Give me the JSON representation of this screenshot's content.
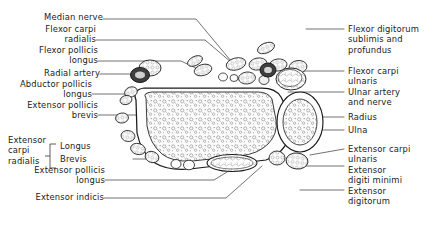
{
  "figure": {
    "type": "anatomical-cross-section",
    "region": "forearm transverse section",
    "background_color": "#ffffff",
    "line_color": "#1a1a1a",
    "artery_fill": "#555555",
    "bone_fill": "#f2f2f2",
    "muscle_fill": "#fafafa"
  },
  "labels_left": [
    {
      "id": "median-nerve",
      "lines": [
        "Median nerve"
      ],
      "align": "right"
    },
    {
      "id": "flexor-carpi-radialis",
      "lines": [
        "Flexor carpi",
        "radialis"
      ],
      "align": "right"
    },
    {
      "id": "flexor-pollicis-longus",
      "lines": [
        "Flexor pollicis",
        "longus"
      ],
      "align": "right"
    },
    {
      "id": "radial-artery",
      "lines": [
        "Radial artery"
      ],
      "align": "right"
    },
    {
      "id": "abductor-pollicis-longus",
      "lines": [
        "Abductor pollicis",
        "longus"
      ],
      "align": "right"
    },
    {
      "id": "extensor-pollicis-brevis",
      "lines": [
        "Extensor pollicis",
        "brevis"
      ],
      "align": "right"
    },
    {
      "id": "extensor-pollicis-longus",
      "lines": [
        "Extensor pollicis",
        "longus"
      ],
      "align": "right"
    },
    {
      "id": "extensor-indicis",
      "lines": [
        "Extensor indicis"
      ],
      "align": "right"
    }
  ],
  "labels_left_grouped": {
    "group_label": {
      "id": "extensor-carpi-radialis",
      "lines": [
        "Extensor",
        "carpi",
        "radialis"
      ]
    },
    "members": [
      {
        "id": "extensor-carpi-radialis-longus",
        "text": "Longus"
      },
      {
        "id": "extensor-carpi-radialis-brevis",
        "text": "Brevis"
      }
    ]
  },
  "labels_right": [
    {
      "id": "flexor-digitorum-sublimis-profundus",
      "lines": [
        "Flexor digitorum",
        "sublimis and",
        "profundus"
      ]
    },
    {
      "id": "flexor-carpi-ulnaris",
      "lines": [
        "Flexor carpi",
        "ulnaris"
      ]
    },
    {
      "id": "ulnar-artery-and-nerve",
      "lines": [
        "Ulnar artery",
        "and nerve"
      ]
    },
    {
      "id": "radius",
      "lines": [
        "Radius"
      ]
    },
    {
      "id": "ulna",
      "lines": [
        "Ulna"
      ]
    },
    {
      "id": "extensor-carpi-ulnaris",
      "lines": [
        "Extensor carpi",
        "ulnaris"
      ]
    },
    {
      "id": "extensor-digiti-minimi",
      "lines": [
        "Extensor",
        "digiti minimi"
      ]
    },
    {
      "id": "extensor-digitorum",
      "lines": [
        "Extensor",
        "digitorum"
      ]
    }
  ]
}
